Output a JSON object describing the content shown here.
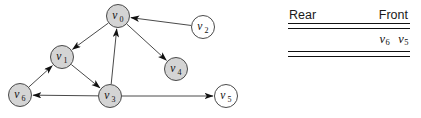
{
  "figure": {
    "graph": {
      "title": "directed-graph-diagram",
      "node_fill_shaded": "#d4d4d4",
      "node_fill_plain": "#ffffff",
      "node_stroke": "#4a4a4a",
      "edge_color": "#4a4a4a",
      "arrow_color": "#111111",
      "nodes": [
        {
          "id": "v0",
          "label": "v",
          "sub": "0",
          "cx": 118,
          "cy": 16,
          "r": 11.5,
          "shaded": true
        },
        {
          "id": "v1",
          "label": "v",
          "sub": "1",
          "cx": 62,
          "cy": 57,
          "r": 11.5,
          "shaded": true
        },
        {
          "id": "v2",
          "label": "v",
          "sub": "2",
          "cx": 203,
          "cy": 27,
          "r": 11.5,
          "shaded": false
        },
        {
          "id": "v3",
          "label": "v",
          "sub": "3",
          "cx": 110,
          "cy": 96,
          "r": 11.5,
          "shaded": true
        },
        {
          "id": "v4",
          "label": "v",
          "sub": "4",
          "cx": 176,
          "cy": 69,
          "r": 11.5,
          "shaded": true
        },
        {
          "id": "v5",
          "label": "v",
          "sub": "5",
          "cx": 226,
          "cy": 96,
          "r": 11.5,
          "shaded": false
        },
        {
          "id": "v6",
          "label": "v",
          "sub": "6",
          "cx": 20,
          "cy": 95,
          "r": 11.5,
          "shaded": true
        }
      ],
      "edges": [
        {
          "from": "v0",
          "to": "v1",
          "directed": true
        },
        {
          "from": "v0",
          "to": "v4",
          "directed": true
        },
        {
          "from": "v2",
          "to": "v0",
          "directed": true
        },
        {
          "from": "v3",
          "to": "v0",
          "directed": true
        },
        {
          "from": "v6",
          "to": "v1",
          "directed": true
        },
        {
          "from": "v1",
          "to": "v3",
          "directed": true
        },
        {
          "from": "v3",
          "to": "v6",
          "directed": true
        },
        {
          "from": "v3",
          "to": "v5",
          "directed": true
        }
      ]
    },
    "queue": {
      "rear_label": "Rear",
      "front_label": "Front",
      "items": [
        {
          "label": "v",
          "sub": "6"
        },
        {
          "label": "v",
          "sub": "5"
        }
      ]
    }
  }
}
